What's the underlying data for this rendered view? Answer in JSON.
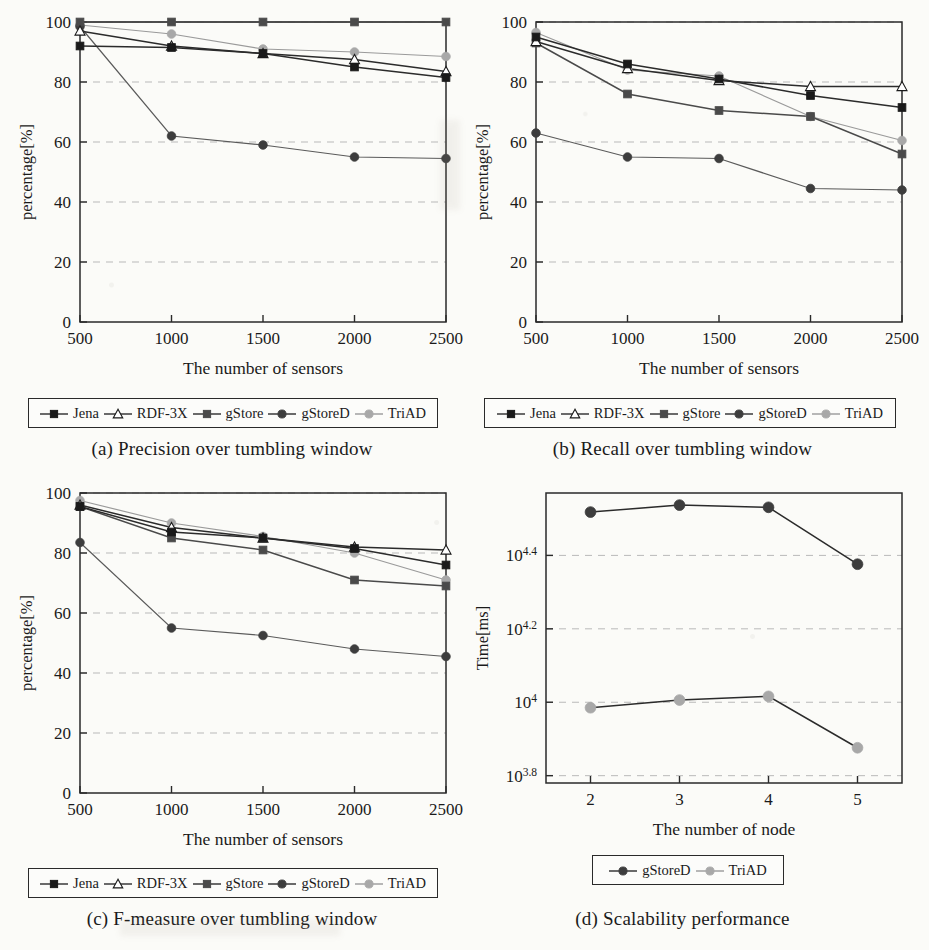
{
  "figure": {
    "background_color": "#fbfbf8",
    "ink_color": "#1a1a1a"
  },
  "series_styles": {
    "Jena": {
      "color": "#1a1a1a",
      "marker": "square",
      "filled": true,
      "line": "#2b2b2b"
    },
    "RDF-3X": {
      "color": "#ffffff",
      "marker": "triangle",
      "filled": false,
      "line": "#2b2b2b"
    },
    "gStore": {
      "color": "#4a4a4a",
      "marker": "square",
      "filled": true,
      "line": "#4a4a4a"
    },
    "gStoreD": {
      "color": "#3d3d3d",
      "marker": "circle",
      "filled": true,
      "line": "#5a5a5a"
    },
    "TriAD": {
      "color": "#a8a8a8",
      "marker": "circle",
      "filled": true,
      "line": "#9a9a9a"
    }
  },
  "subfigures": [
    {
      "id": "a",
      "caption": "(a) Precision over tumbling window",
      "legend": [
        "Jena",
        "RDF-3X",
        "gStore",
        "gStoreD",
        "TriAD"
      ],
      "chart_data": {
        "type": "line",
        "title": "",
        "xlabel": "The number of sensors",
        "ylabel": "percentage[%]",
        "x": [
          500,
          1000,
          1500,
          2000,
          2500
        ],
        "xticklabels": [
          "500",
          "1000",
          "1500",
          "2000",
          "2500"
        ],
        "yticks": [
          0,
          20,
          40,
          60,
          80,
          100
        ],
        "ylim": [
          0,
          100
        ],
        "grid": "horizontal-dashed",
        "legend_position": "below-axes",
        "series": [
          {
            "name": "Jena",
            "values": [
              92,
              91.5,
              89.5,
              85,
              81.5
            ]
          },
          {
            "name": "RDF-3X",
            "values": [
              97,
              92,
              89.5,
              87.5,
              83.5
            ]
          },
          {
            "name": "gStore",
            "values": [
              100,
              100,
              100,
              100,
              100
            ]
          },
          {
            "name": "gStoreD",
            "values": [
              98.5,
              62,
              59,
              55,
              54.5
            ]
          },
          {
            "name": "TriAD",
            "values": [
              99,
              96,
              91,
              90,
              88.5
            ]
          }
        ]
      }
    },
    {
      "id": "b",
      "caption": "(b) Recall over tumbling window",
      "legend": [
        "Jena",
        "RDF-3X",
        "gStore",
        "gStoreD",
        "TriAD"
      ],
      "chart_data": {
        "type": "line",
        "title": "",
        "xlabel": "The number of sensors",
        "ylabel": "percentage[%]",
        "x": [
          500,
          1000,
          1500,
          2000,
          2500
        ],
        "xticklabels": [
          "500",
          "1000",
          "1500",
          "2000",
          "2500"
        ],
        "yticks": [
          0,
          20,
          40,
          60,
          80,
          100
        ],
        "ylim": [
          0,
          100
        ],
        "grid": "horizontal-dashed",
        "legend_position": "below-axes",
        "series": [
          {
            "name": "Jena",
            "values": [
              95,
              86,
              81,
              75.5,
              71.5
            ]
          },
          {
            "name": "RDF-3X",
            "values": [
              93.5,
              84.5,
              80.5,
              78.5,
              78.5
            ]
          },
          {
            "name": "gStore",
            "values": [
              93,
              76,
              70.5,
              68.5,
              56
            ]
          },
          {
            "name": "gStoreD",
            "values": [
              63,
              55,
              54.5,
              44.5,
              44
            ]
          },
          {
            "name": "TriAD",
            "values": [
              96.5,
              84,
              82,
              68.5,
              60.5
            ]
          }
        ]
      }
    },
    {
      "id": "c",
      "caption": "(c) F-measure over tumbling window",
      "legend": [
        "Jena",
        "RDF-3X",
        "gStore",
        "gStoreD",
        "TriAD"
      ],
      "chart_data": {
        "type": "line",
        "title": "",
        "xlabel": "The number of sensors",
        "ylabel": "percentage[%]",
        "x": [
          500,
          1000,
          1500,
          2000,
          2500
        ],
        "xticklabels": [
          "500",
          "1000",
          "1500",
          "2000",
          "2500"
        ],
        "yticks": [
          0,
          20,
          40,
          60,
          80,
          100
        ],
        "ylim": [
          0,
          100
        ],
        "grid": "horizontal-dashed",
        "legend_position": "below-axes",
        "series": [
          {
            "name": "Jena",
            "values": [
              95.5,
              87,
              85,
              81.5,
              76
            ]
          },
          {
            "name": "RDF-3X",
            "values": [
              96,
              88.5,
              85,
              82,
              81
            ]
          },
          {
            "name": "gStore",
            "values": [
              95.5,
              85,
              81,
              71,
              69
            ]
          },
          {
            "name": "gStoreD",
            "values": [
              83.5,
              55,
              52.5,
              48,
              45.5
            ]
          },
          {
            "name": "TriAD",
            "values": [
              97.5,
              90,
              85.5,
              80,
              71
            ]
          }
        ]
      }
    },
    {
      "id": "d",
      "caption": "(d) Scalability performance",
      "legend": [
        "gStoreD",
        "TriAD"
      ],
      "chart_data": {
        "type": "line",
        "title": "",
        "xlabel": "The number of node",
        "ylabel": "Time[ms]",
        "x": [
          2,
          3,
          4,
          5
        ],
        "xticklabels": [
          "2",
          "3",
          "4",
          "5"
        ],
        "yticklabels": [
          "10^3.8",
          "10^4",
          "10^4.2",
          "10^4.4"
        ],
        "ytick_exponents": [
          3.8,
          4.0,
          4.2,
          4.4
        ],
        "yscale": "log",
        "ylim_log10": [
          3.78,
          4.57
        ],
        "grid": "horizontal-dashed",
        "legend_position": "below-axes",
        "series": [
          {
            "name": "gStoreD",
            "values_log10": [
              4.518,
              4.537,
              4.531,
              4.376
            ]
          },
          {
            "name": "TriAD",
            "values_log10": [
              3.985,
              4.006,
              4.016,
              3.876
            ]
          }
        ]
      }
    }
  ]
}
